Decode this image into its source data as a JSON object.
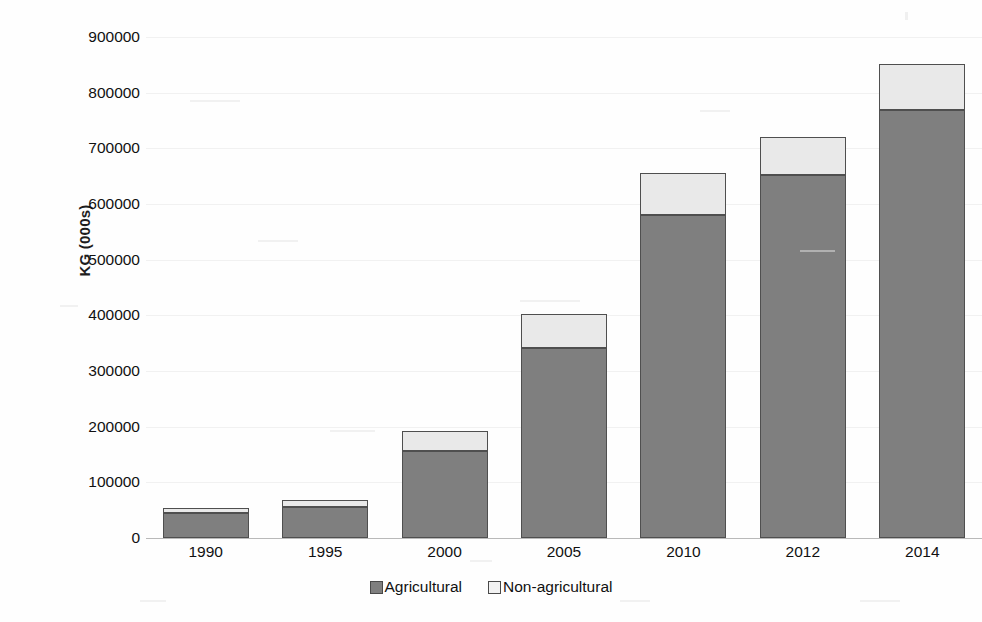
{
  "chart_data": {
    "type": "bar",
    "subtype": "stacked-bar",
    "title": "",
    "subtitle": "",
    "xlabel": "",
    "ylabel": "KG (000s)",
    "categories": [
      "1990",
      "1995",
      "2000",
      "2005",
      "2010",
      "2012",
      "2014"
    ],
    "series": [
      {
        "name": "Agricultural",
        "color": "#7f7f7f",
        "values": [
          45000,
          55000,
          157000,
          342000,
          581000,
          652000,
          768000
        ]
      },
      {
        "name": "Non-agricultural",
        "color": "#e9e9e9",
        "values": [
          9000,
          13000,
          36000,
          61000,
          74000,
          69000,
          83000
        ]
      }
    ],
    "totals": [
      54000,
      68000,
      193000,
      403000,
      655000,
      721000,
      851000
    ],
    "ylim": [
      0,
      900000
    ],
    "ytick_values": [
      0,
      100000,
      200000,
      300000,
      400000,
      500000,
      600000,
      700000,
      800000,
      900000
    ],
    "ytick_labels": [
      "0",
      "100000",
      "200000",
      "300000",
      "400000",
      "500000",
      "600000",
      "700000",
      "800000",
      "900000"
    ],
    "grid": true,
    "legend_position": "bottom",
    "legend_entries": [
      "Agricultural",
      "Non-agricultural"
    ]
  },
  "axes": {
    "y_title": "KG (000s)"
  },
  "legend": {
    "items": [
      {
        "label": "Agricultural",
        "swatch": "filled-gray-square-icon"
      },
      {
        "label": "Non-agricultural",
        "swatch": "outline-white-square-icon"
      }
    ]
  }
}
